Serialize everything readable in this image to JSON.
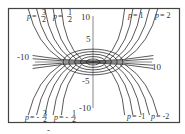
{
  "chart_data": {
    "type": "line",
    "title": "",
    "xlabel": "",
    "ylabel": "",
    "xlim": [
      -13.5,
      16
    ],
    "ylim": [
      -13.5,
      12
    ],
    "grid": false,
    "x_ticks": [
      {
        "value": -10,
        "label": "-10"
      },
      {
        "value": 10,
        "label": "10"
      }
    ],
    "y_ticks": [
      {
        "value": 10,
        "label": "10"
      },
      {
        "value": 5,
        "label": "5"
      },
      {
        "value": -5,
        "label": "-5"
      },
      {
        "value": -10,
        "label": "-10"
      }
    ],
    "ellipse_radii": [
      1.2,
      2.2,
      3.2,
      4.2,
      5.2
    ],
    "series": [
      {
        "name": "p = 3/2",
        "p": 1.5,
        "direction": "up-left",
        "label_pos": "top"
      },
      {
        "name": "p = 1/2",
        "p": 0.5,
        "direction": "up-left",
        "label_pos": "top"
      },
      {
        "name": "p = 1",
        "p": 1,
        "direction": "up-right",
        "label_pos": "top"
      },
      {
        "name": "p = 2",
        "p": 2,
        "direction": "up-right",
        "label_pos": "top"
      },
      {
        "name": "p = -3/2",
        "p": -1.5,
        "direction": "down-left",
        "label_pos": "bottom"
      },
      {
        "name": "p = -1/2",
        "p": -0.5,
        "direction": "down-left",
        "label_pos": "bottom"
      },
      {
        "name": "p = -1",
        "p": -1,
        "direction": "down-right",
        "label_pos": "bottom"
      },
      {
        "name": "p = -2",
        "p": -2,
        "direction": "down-right",
        "label_pos": "bottom"
      }
    ],
    "annotations": [
      {
        "text": "p = 3/2",
        "x": -10.5,
        "y": 11.5
      },
      {
        "text": "p = 1/2",
        "x": -6.5,
        "y": 11.5
      },
      {
        "text": "p = 1",
        "x": 3.5,
        "y": 11.5
      },
      {
        "text": "p = 2",
        "x": 8,
        "y": 11.5
      },
      {
        "text": "p = -3/2",
        "x": -10.5,
        "y": -12.5
      },
      {
        "text": "p = -1/2",
        "x": -5,
        "y": -12.5
      },
      {
        "text": "p = -1",
        "x": 3.5,
        "y": -12.5
      },
      {
        "text": "p = -2",
        "x": 8,
        "y": -12.5
      }
    ]
  },
  "labels": {
    "top_left_1": {
      "p": "p",
      "eq": "=",
      "num": "3",
      "den": "2"
    },
    "top_left_2": {
      "p": "p",
      "eq": "=",
      "num": "1",
      "den": "2"
    },
    "top_right_1": {
      "p": "p",
      "eq": "= 1"
    },
    "top_right_2": {
      "p": "p",
      "eq": "= 2"
    },
    "bot_left_1": {
      "p": "p",
      "eq": "= -",
      "num": "3",
      "den": "2"
    },
    "bot_left_2": {
      "p": "p",
      "eq": "= -",
      "num": "1",
      "den": "2"
    },
    "bot_right_1": {
      "p": "p",
      "eq": "= -1"
    },
    "bot_right_2": {
      "p": "p",
      "eq": "= -2"
    }
  },
  "ticks": {
    "x_neg10": "-10",
    "x_pos10": "10",
    "y_pos10": "10",
    "y_pos5": "5",
    "y_neg5": "-5",
    "y_neg10": "-10"
  }
}
